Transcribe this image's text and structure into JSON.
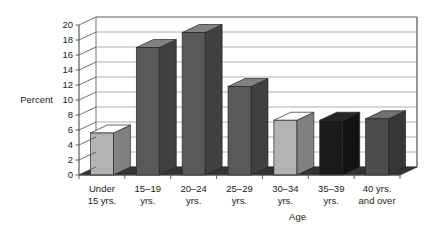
{
  "chart_data": {
    "type": "bar",
    "title": "",
    "subtitle": "",
    "xlabel": "Age",
    "ylabel": "Percent",
    "categories": [
      "Under 15 yrs.",
      "15–19 yrs.",
      "20–24 yrs.",
      "25–29 yrs.",
      "30–34 yrs.",
      "35–39 yrs.",
      "40 yrs. and over"
    ],
    "category_lines": [
      [
        "Under",
        "15 yrs."
      ],
      [
        "15–19",
        "yrs."
      ],
      [
        "20–24",
        "yrs."
      ],
      [
        "25–29",
        "yrs."
      ],
      [
        "30–34",
        "yrs."
      ],
      [
        "35–39",
        "yrs."
      ],
      [
        "40 yrs.",
        "and over"
      ]
    ],
    "values": [
      5.6,
      17.0,
      19.0,
      11.8,
      7.3,
      7.3,
      7.5
    ],
    "bar_colors": [
      "#b3b3b3",
      "#595959",
      "#595959",
      "#595959",
      "#b3b3b3",
      "#1a1a1a",
      "#4d4d4d"
    ],
    "ylim": [
      0,
      20
    ],
    "ytick_step": 2,
    "yticks": [
      0,
      2,
      4,
      6,
      8,
      10,
      12,
      14,
      16,
      18,
      20
    ],
    "grid": true,
    "legend": "none",
    "style": "3d-column",
    "floor_color": "#333333",
    "wall_color": "#ffffff",
    "gridline_color": "#999999",
    "axis_color": "#4d4d4d"
  },
  "labels": {
    "y_axis_title": "Percent",
    "x_axis_title": "Age"
  }
}
